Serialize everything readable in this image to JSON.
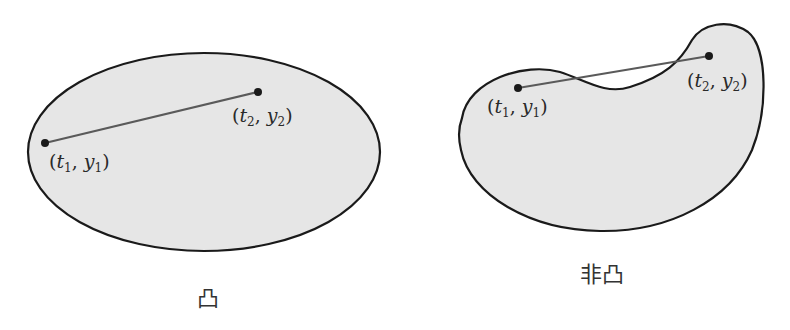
{
  "colors": {
    "fill": "#e6e6e6",
    "outline": "#1a1a1a",
    "segment": "#5a5a5a",
    "point": "#1a1a1a"
  },
  "convex": {
    "caption": "凸",
    "point1": {
      "var_t": "t",
      "sub_t": "1",
      "var_y": "y",
      "sub_y": "1",
      "x": 45,
      "y": 143
    },
    "point2": {
      "var_t": "t",
      "sub_t": "2",
      "var_y": "y",
      "sub_y": "2",
      "x": 258,
      "y": 92
    }
  },
  "nonconvex": {
    "caption": "非凸",
    "point1": {
      "var_t": "t",
      "sub_t": "1",
      "var_y": "y",
      "sub_y": "1",
      "x": 518,
      "y": 88
    },
    "point2": {
      "var_t": "t",
      "sub_t": "2",
      "var_y": "y",
      "sub_y": "2",
      "x": 709,
      "y": 56
    }
  },
  "glyphs": {
    "open": "(",
    "close": ")",
    "comma": ", "
  }
}
